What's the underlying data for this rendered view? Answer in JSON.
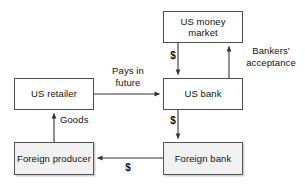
{
  "diagram": {
    "background_color": "#ffffff",
    "line_color": "#333333",
    "node_border_color": "#4d4d4d",
    "node_fill_plain": "#ffffff",
    "node_fill_shaded": "#f1f1f1",
    "nodes": [
      {
        "id": "us_money_market",
        "label": "US money\nmarket",
        "shaded": false,
        "x": 163,
        "y": 11,
        "w": 80,
        "h": 32
      },
      {
        "id": "us_retailer",
        "label": "US retailer",
        "shaded": false,
        "x": 14,
        "y": 78,
        "w": 80,
        "h": 32
      },
      {
        "id": "us_bank",
        "label": "US bank",
        "shaded": false,
        "x": 163,
        "y": 78,
        "w": 80,
        "h": 32
      },
      {
        "id": "foreign_producer",
        "label": "Foreign\nproducer",
        "shaded": true,
        "x": 14,
        "y": 142,
        "w": 80,
        "h": 33
      },
      {
        "id": "foreign_bank",
        "label": "Foreign\nbank",
        "shaded": true,
        "x": 163,
        "y": 142,
        "w": 80,
        "h": 33
      }
    ],
    "edges": [
      {
        "id": "money-market-to-us-bank",
        "from": "us_money_market",
        "to": "us_bank",
        "label": "$",
        "label_x": 167,
        "label_y": 50,
        "label_w": 12,
        "align": "center"
      },
      {
        "id": "us-bank-to-money-market",
        "from": "us_bank",
        "to": "us_money_market",
        "label": "Bankers'\nacceptance",
        "label_x": 240,
        "label_y": 45,
        "label_w": 62,
        "align": "center"
      },
      {
        "id": "us-retailer-to-us-bank",
        "from": "us_retailer",
        "to": "us_bank",
        "label": "Pays in\nfuture",
        "label_x": 100,
        "label_y": 65,
        "label_w": 56,
        "align": "center"
      },
      {
        "id": "us-bank-to-foreign-bank",
        "from": "us_bank",
        "to": "foreign_bank",
        "label": "$",
        "label_x": 167,
        "label_y": 115,
        "label_w": 12,
        "align": "center"
      },
      {
        "id": "foreign-producer-to-us-retailer",
        "from": "foreign_producer",
        "to": "us_retailer",
        "label": "Goods",
        "label_x": 60,
        "label_y": 114,
        "label_w": 34,
        "align": "left"
      },
      {
        "id": "foreign-bank-to-foreign-producer",
        "from": "foreign_bank",
        "to": "foreign_producer",
        "label": "$",
        "label_x": 122,
        "label_y": 162,
        "label_w": 12,
        "align": "center"
      }
    ]
  }
}
